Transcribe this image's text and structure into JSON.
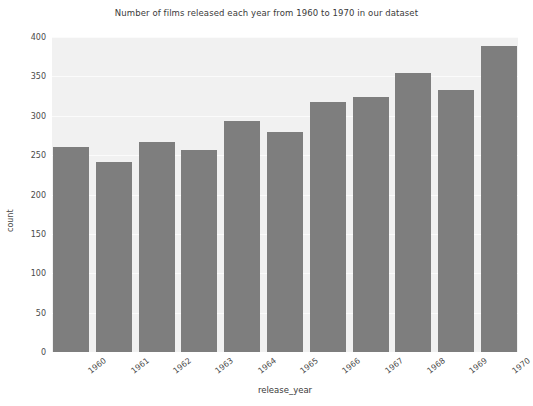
{
  "chart_data": {
    "type": "bar",
    "title": "Number of films released each year from 1960 to 1970 in our dataset",
    "xlabel": "release_year",
    "ylabel": "count",
    "categories": [
      "1960",
      "1961",
      "1962",
      "1963",
      "1964",
      "1965",
      "1966",
      "1967",
      "1968",
      "1969",
      "1970"
    ],
    "values": [
      260,
      241,
      267,
      256,
      293,
      279,
      317,
      324,
      354,
      333,
      389
    ],
    "yticks": [
      0,
      50,
      100,
      150,
      200,
      250,
      300,
      350,
      400
    ],
    "ylim": [
      0,
      400
    ],
    "grid": true,
    "legend": "none",
    "colors": {
      "bar": "#7e7e7e",
      "plot_background": "#f1f1f1",
      "figure_background": "#ffffff",
      "gridline": "#fbfbfb",
      "text": "#4a4a4a"
    }
  }
}
